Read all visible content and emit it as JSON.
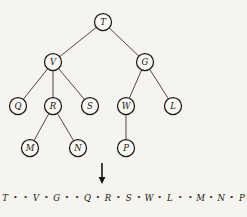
{
  "figure": {
    "background_color": "#f6f4ef",
    "ink_color": "#15130f",
    "width": 247,
    "height": 217
  },
  "tree": {
    "node_radius": 8.5,
    "nodes": [
      {
        "id": "T",
        "label": "T",
        "x": 103,
        "y": 22,
        "level": 0
      },
      {
        "id": "V",
        "label": "V",
        "x": 53,
        "y": 62,
        "level": 1
      },
      {
        "id": "G",
        "label": "G",
        "x": 145,
        "y": 62,
        "level": 1
      },
      {
        "id": "Q",
        "label": "Q",
        "x": 18,
        "y": 106,
        "level": 2
      },
      {
        "id": "R",
        "label": "R",
        "x": 53,
        "y": 106,
        "level": 2
      },
      {
        "id": "S",
        "label": "S",
        "x": 90,
        "y": 106,
        "level": 2
      },
      {
        "id": "W",
        "label": "W",
        "x": 126,
        "y": 106,
        "level": 2
      },
      {
        "id": "L",
        "label": "L",
        "x": 173,
        "y": 106,
        "level": 2
      },
      {
        "id": "M",
        "label": "M",
        "x": 30,
        "y": 148,
        "level": 3
      },
      {
        "id": "N",
        "label": "N",
        "x": 78,
        "y": 148,
        "level": 3
      },
      {
        "id": "P",
        "label": "P",
        "x": 126,
        "y": 148,
        "level": 3
      }
    ],
    "edges": [
      {
        "from": "T",
        "to": "V"
      },
      {
        "from": "T",
        "to": "G"
      },
      {
        "from": "V",
        "to": "Q"
      },
      {
        "from": "V",
        "to": "R"
      },
      {
        "from": "V",
        "to": "S"
      },
      {
        "from": "G",
        "to": "W"
      },
      {
        "from": "G",
        "to": "L"
      },
      {
        "from": "R",
        "to": "M"
      },
      {
        "from": "R",
        "to": "N"
      },
      {
        "from": "W",
        "to": "P"
      }
    ]
  },
  "arrow": {
    "name": "downward-arrow",
    "x": 102,
    "y_top": 163,
    "y_bottom": 184
  },
  "sequence": {
    "dot_glyph": "•",
    "items": [
      "T",
      "•",
      "•",
      "V",
      "•",
      "G",
      "•",
      "•",
      "Q",
      "•",
      "R",
      "•",
      "S",
      "•",
      "W",
      "•",
      "L",
      "•",
      "•",
      "M",
      "•",
      "N",
      "•",
      "P"
    ],
    "text": "T • • V • G • • Q • R • S • W • L • • M • N • P"
  }
}
